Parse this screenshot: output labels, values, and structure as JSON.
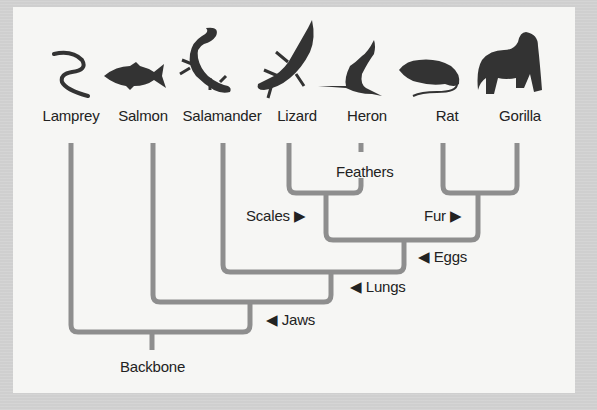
{
  "diagram": {
    "type": "cladogram",
    "colors": {
      "branch": "#8e8e8e",
      "silhouette": "#333333",
      "text": "#222222",
      "panel": "#f6f6f4",
      "border": "#cfcfcf"
    },
    "taxa": [
      {
        "name": "Lamprey",
        "icon": "lamprey-icon"
      },
      {
        "name": "Salmon",
        "icon": "salmon-icon"
      },
      {
        "name": "Salamander",
        "icon": "salamander-icon"
      },
      {
        "name": "Lizard",
        "icon": "lizard-icon"
      },
      {
        "name": "Heron",
        "icon": "heron-icon"
      },
      {
        "name": "Rat",
        "icon": "rat-icon"
      },
      {
        "name": "Gorilla",
        "icon": "gorilla-icon"
      }
    ],
    "traits": {
      "backbone": "Backbone",
      "jaws": "◀ Jaws",
      "lungs": "◀ Lungs",
      "eggs": "◀ Eggs",
      "scales": "Scales ▶",
      "fur": "Fur ▶",
      "feathers": "Feathers"
    }
  }
}
